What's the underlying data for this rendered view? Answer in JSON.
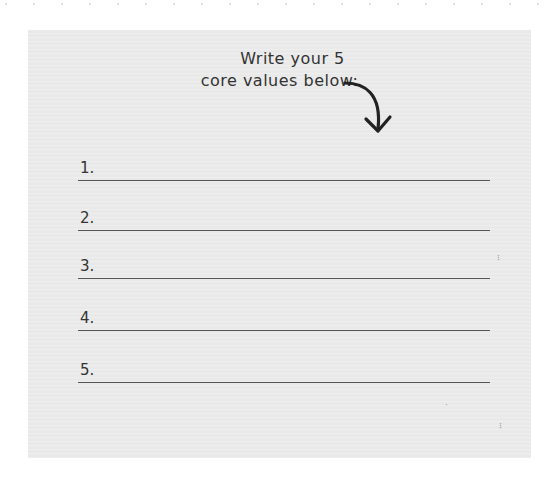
{
  "worksheet": {
    "heading_line1": "Write your 5",
    "heading_line2": "core values below:",
    "arrow_icon": "curved-arrow-down-icon",
    "entries": [
      {
        "label": "1.",
        "value": ""
      },
      {
        "label": "2.",
        "value": ""
      },
      {
        "label": "3.",
        "value": ""
      },
      {
        "label": "4.",
        "value": ""
      },
      {
        "label": "5.",
        "value": ""
      }
    ]
  },
  "colors": {
    "paper": "#e9e9e9",
    "ink": "#333333",
    "rule": "#555555"
  }
}
